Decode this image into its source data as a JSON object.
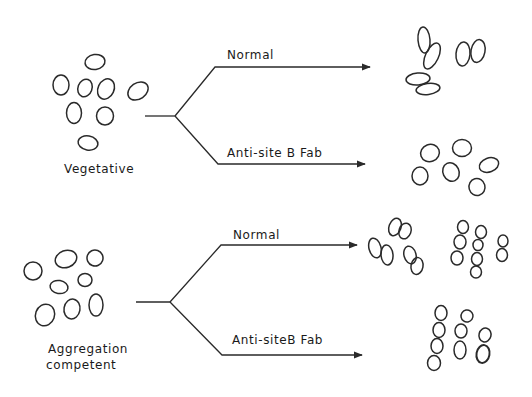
{
  "diagram": {
    "type": "branching-schematic",
    "background": "#ffffff",
    "ink_color": "#2a2a2a",
    "panels": [
      {
        "id": "vegetative",
        "label": "Vegetative",
        "branches": [
          {
            "label": "Normal",
            "outcome": "cells pairing in doublets"
          },
          {
            "label": "Anti-site B  Fab",
            "outcome": "cells remain single/dispersed"
          }
        ]
      },
      {
        "id": "aggregation-competent",
        "label_line1": "Aggregation",
        "label_line2": "competent",
        "branches": [
          {
            "label": "Normal",
            "outcome": "doublets and chains of cells"
          },
          {
            "label": "Anti-site B  Fab",
            "outcome": "chains of cells"
          }
        ]
      }
    ]
  },
  "labels": {
    "vegetative": "Vegetative",
    "veg_normal": "Normal",
    "veg_fab": "Anti-site B  Fab",
    "agg_line1": "Aggregation",
    "agg_line2": "competent",
    "agg_normal": "Normal",
    "agg_fab": "Anti-siteB  Fab"
  }
}
